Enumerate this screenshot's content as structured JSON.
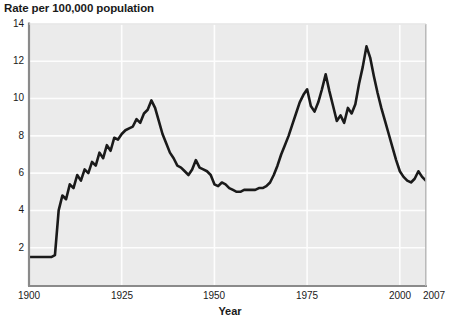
{
  "chart_data": {
    "type": "line",
    "title": "Rate per 100,000 population",
    "xlabel": "Year",
    "ylabel": "",
    "xlim": [
      1900,
      2007
    ],
    "ylim": [
      0,
      14
    ],
    "grid": true,
    "legend": "none",
    "xticks": [
      1900,
      1925,
      1950,
      1975,
      2000,
      2007
    ],
    "xticklabels": [
      "1900",
      "1925",
      "1950",
      "1975",
      "2000",
      "2007"
    ],
    "yticks": [
      2,
      4,
      6,
      8,
      10,
      12,
      14
    ],
    "yticklabels": [
      "2",
      "4",
      "6",
      "8",
      "10",
      "12",
      "14"
    ],
    "series": [
      {
        "name": "Rate per 100,000 population",
        "color": "#1a1a1a",
        "x": [
          1900,
          1901,
          1902,
          1903,
          1904,
          1905,
          1906,
          1907,
          1908,
          1909,
          1910,
          1911,
          1912,
          1913,
          1914,
          1915,
          1916,
          1917,
          1918,
          1919,
          1920,
          1921,
          1922,
          1923,
          1924,
          1925,
          1926,
          1927,
          1928,
          1929,
          1930,
          1931,
          1932,
          1933,
          1934,
          1935,
          1936,
          1937,
          1938,
          1939,
          1940,
          1941,
          1942,
          1943,
          1944,
          1945,
          1946,
          1947,
          1948,
          1949,
          1950,
          1951,
          1952,
          1953,
          1954,
          1955,
          1956,
          1957,
          1958,
          1959,
          1960,
          1961,
          1962,
          1963,
          1964,
          1965,
          1966,
          1967,
          1968,
          1969,
          1970,
          1971,
          1972,
          1973,
          1974,
          1975,
          1976,
          1977,
          1978,
          1979,
          1980,
          1981,
          1982,
          1983,
          1984,
          1985,
          1986,
          1987,
          1988,
          1989,
          1990,
          1991,
          1992,
          1993,
          1994,
          1995,
          1996,
          1997,
          1998,
          1999,
          2000,
          2001,
          2002,
          2003,
          2004,
          2005,
          2006,
          2007
        ],
        "y": [
          1.5,
          1.5,
          1.5,
          1.5,
          1.5,
          1.5,
          1.5,
          1.6,
          4.0,
          4.8,
          4.6,
          5.4,
          5.2,
          5.9,
          5.6,
          6.2,
          6.0,
          6.6,
          6.4,
          7.1,
          6.8,
          7.5,
          7.2,
          7.9,
          7.8,
          8.1,
          8.3,
          8.4,
          8.5,
          8.9,
          8.7,
          9.2,
          9.4,
          9.9,
          9.5,
          8.8,
          8.1,
          7.6,
          7.1,
          6.8,
          6.4,
          6.3,
          6.1,
          5.9,
          6.2,
          6.7,
          6.3,
          6.2,
          6.1,
          5.9,
          5.4,
          5.3,
          5.5,
          5.4,
          5.2,
          5.1,
          5.0,
          5.0,
          5.1,
          5.1,
          5.1,
          5.1,
          5.2,
          5.2,
          5.3,
          5.5,
          5.9,
          6.4,
          7.0,
          7.5,
          8.0,
          8.6,
          9.2,
          9.8,
          10.2,
          10.5,
          9.6,
          9.3,
          9.8,
          10.5,
          11.3,
          10.4,
          9.6,
          8.8,
          9.1,
          8.7,
          9.5,
          9.2,
          9.7,
          10.8,
          11.7,
          12.8,
          12.2,
          11.2,
          10.3,
          9.5,
          8.8,
          8.1,
          7.4,
          6.7,
          6.1,
          5.8,
          5.6,
          5.5,
          5.7,
          6.1,
          5.8,
          5.6
        ]
      }
    ]
  },
  "axes": {
    "y_tick_labels": [
      "14",
      "12",
      "10",
      "8",
      "6",
      "4",
      "2"
    ],
    "x_tick_labels": [
      "1900",
      "1925",
      "1950",
      "1975",
      "2000",
      "2007"
    ]
  }
}
